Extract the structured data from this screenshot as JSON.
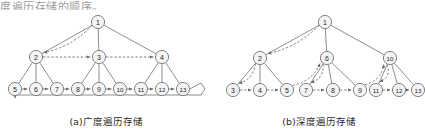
{
  "page": {
    "partial_top_text": "度遍历存储的顺序。"
  },
  "style": {
    "node_stroke": "#6e6e6e",
    "node_fill": "#f4f4f4",
    "edge_color": "#7a7a7a",
    "dashed_color": "#6a6a6a",
    "label_color": "#1f1f1f",
    "node_radius": 6.6
  },
  "diagrams": [
    {
      "id": "breadth-first",
      "caption": "(a)广度遍历存储",
      "nodes": [
        {
          "id": "1",
          "label": "1",
          "x": 98,
          "y": 22
        },
        {
          "id": "2",
          "label": "2",
          "x": 36,
          "y": 57
        },
        {
          "id": "3",
          "label": "3",
          "x": 99,
          "y": 57
        },
        {
          "id": "4",
          "label": "4",
          "x": 162,
          "y": 57
        },
        {
          "id": "5",
          "label": "5",
          "x": 15,
          "y": 89
        },
        {
          "id": "6",
          "label": "6",
          "x": 36,
          "y": 89
        },
        {
          "id": "7",
          "label": "7",
          "x": 57,
          "y": 89
        },
        {
          "id": "8",
          "label": "8",
          "x": 78,
          "y": 89
        },
        {
          "id": "9",
          "label": "9",
          "x": 99,
          "y": 89
        },
        {
          "id": "10",
          "label": "10",
          "x": 120,
          "y": 89
        },
        {
          "id": "11",
          "label": "11",
          "x": 141,
          "y": 89
        },
        {
          "id": "12",
          "label": "12",
          "x": 162,
          "y": 89
        },
        {
          "id": "13",
          "label": "13",
          "x": 183,
          "y": 89
        }
      ],
      "tree_edges": [
        [
          "1",
          "2"
        ],
        [
          "1",
          "3"
        ],
        [
          "1",
          "4"
        ],
        [
          "2",
          "5"
        ],
        [
          "2",
          "6"
        ],
        [
          "2",
          "7"
        ],
        [
          "3",
          "8"
        ],
        [
          "3",
          "9"
        ],
        [
          "3",
          "10"
        ],
        [
          "4",
          "11"
        ],
        [
          "4",
          "12"
        ],
        [
          "4",
          "13"
        ]
      ],
      "traversal_arrows": [
        [
          "2",
          "3"
        ],
        [
          "3",
          "4"
        ],
        [
          "5",
          "6"
        ],
        [
          "6",
          "7"
        ],
        [
          "7",
          "8"
        ],
        [
          "8",
          "9"
        ],
        [
          "9",
          "10"
        ],
        [
          "10",
          "11"
        ],
        [
          "11",
          "12"
        ],
        [
          "12",
          "13"
        ]
      ],
      "curved_arrow": {
        "from": "1",
        "to": "2"
      },
      "wrap_arrow": {
        "from": "13",
        "to": "5"
      },
      "order": [
        "1",
        "2",
        "3",
        "4",
        "5",
        "6",
        "7",
        "8",
        "9",
        "10",
        "11",
        "12",
        "13"
      ]
    },
    {
      "id": "depth-first",
      "caption": "(b)深度遍历存储",
      "nodes": [
        {
          "id": "1",
          "label": "1",
          "x": 112,
          "y": 22
        },
        {
          "id": "2",
          "label": "2",
          "x": 47,
          "y": 58
        },
        {
          "id": "6",
          "label": "6",
          "x": 114,
          "y": 58
        },
        {
          "id": "10",
          "label": "10",
          "x": 177,
          "y": 58
        },
        {
          "id": "3",
          "label": "3",
          "x": 20,
          "y": 90
        },
        {
          "id": "4",
          "label": "4",
          "x": 47,
          "y": 90
        },
        {
          "id": "5",
          "label": "5",
          "x": 74,
          "y": 90
        },
        {
          "id": "7",
          "label": "7",
          "x": 93,
          "y": 90
        },
        {
          "id": "8",
          "label": "8",
          "x": 120,
          "y": 90
        },
        {
          "id": "9",
          "label": "9",
          "x": 147,
          "y": 90
        },
        {
          "id": "11",
          "label": "11",
          "x": 163,
          "y": 90
        },
        {
          "id": "12",
          "label": "12",
          "x": 186,
          "y": 90
        },
        {
          "id": "13",
          "label": "13",
          "x": 205,
          "y": 90
        }
      ],
      "tree_edges": [
        [
          "1",
          "2"
        ],
        [
          "1",
          "6"
        ],
        [
          "1",
          "10"
        ],
        [
          "2",
          "3"
        ],
        [
          "2",
          "4"
        ],
        [
          "2",
          "5"
        ],
        [
          "6",
          "7"
        ],
        [
          "6",
          "8"
        ],
        [
          "6",
          "9"
        ],
        [
          "10",
          "11"
        ],
        [
          "10",
          "12"
        ],
        [
          "10",
          "13"
        ]
      ],
      "traversal_arrows": [
        [
          "3",
          "4"
        ],
        [
          "4",
          "5"
        ],
        [
          "7",
          "8"
        ],
        [
          "8",
          "9"
        ],
        [
          "11",
          "12"
        ],
        [
          "12",
          "13"
        ]
      ],
      "curved_arrows": [
        {
          "from": "1",
          "to": "2"
        },
        {
          "from": "2",
          "to": "3"
        },
        {
          "from": "5",
          "to": "6"
        },
        {
          "from": "6",
          "to": "7"
        },
        {
          "from": "9",
          "to": "10"
        },
        {
          "from": "10",
          "to": "11"
        }
      ],
      "order": [
        "1",
        "2",
        "3",
        "4",
        "5",
        "6",
        "7",
        "8",
        "9",
        "10",
        "11",
        "12",
        "13"
      ]
    }
  ]
}
